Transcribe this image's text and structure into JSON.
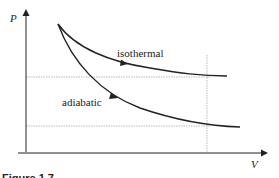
{
  "diagram": {
    "y_axis_label": "P",
    "x_axis_label": "V",
    "curves": [
      {
        "name": "isothermal",
        "label": "isothermal"
      },
      {
        "name": "adiabatic",
        "label": "adiabatic"
      }
    ],
    "caption": "Figure 1.7"
  }
}
